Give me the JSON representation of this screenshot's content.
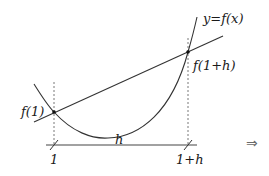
{
  "diagram": {
    "labels": {
      "curve": "y=f(x)",
      "point_left": "f(1)",
      "point_right": "f(1+h)",
      "interval": "h",
      "x_left": "1",
      "x_right": "1+h"
    },
    "implies_symbol": "⇒",
    "colors": {
      "stroke": "#333333",
      "dashed": "#555555",
      "text": "#1a1a1a",
      "arrow": "#6a6a6a"
    }
  }
}
